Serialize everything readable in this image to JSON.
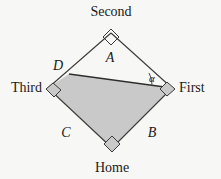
{
  "figure": {
    "type": "geometry-diagram",
    "background_color": "#f7f7f5",
    "shaded_fill_color": "#c9c9c9",
    "stroke_color": "#3a3a3a"
  },
  "vertices": [
    {
      "id": "second",
      "label": "Second",
      "x": 111,
      "y": 33,
      "label_x": 111,
      "label_y": 16,
      "anchor": "middle",
      "right_angle": true
    },
    {
      "id": "third",
      "label": "Third",
      "x": 48,
      "y": 88,
      "label_x": 42,
      "label_y": 92,
      "anchor": "end",
      "right_angle": true
    },
    {
      "id": "first",
      "label": "First",
      "x": 172,
      "y": 88,
      "label_x": 179,
      "label_y": 92,
      "anchor": "start",
      "right_angle": true
    },
    {
      "id": "home",
      "label": "Home",
      "x": 112,
      "y": 148,
      "label_x": 112,
      "label_y": 172,
      "anchor": "middle",
      "right_angle": true
    }
  ],
  "points": [
    {
      "id": "d",
      "label": "D",
      "x": 69,
      "y": 74,
      "label_x": 58,
      "label_y": 70
    }
  ],
  "region_labels": [
    {
      "id": "region-a",
      "label": "A",
      "x": 110,
      "y": 62
    },
    {
      "id": "side-b",
      "label": "B",
      "x": 152,
      "y": 137
    },
    {
      "id": "side-c",
      "label": "C",
      "x": 66,
      "y": 137
    }
  ],
  "angles": [
    {
      "id": "alpha",
      "label": "α",
      "x": 152,
      "y": 82,
      "at_vertex": "first"
    }
  ],
  "edges": [
    {
      "id": "edge-second-third",
      "from": "second",
      "to": "third"
    },
    {
      "id": "edge-second-first",
      "from": "second",
      "to": "first"
    },
    {
      "id": "edge-third-home",
      "from": "third",
      "to": "home"
    },
    {
      "id": "edge-first-home",
      "from": "first",
      "to": "home"
    }
  ],
  "chord": {
    "id": "chord-d-first",
    "from": "d",
    "to": "first"
  },
  "shaded_polygon": {
    "id": "shaded-region",
    "points": "69,74 172,88 112,148 48,88"
  }
}
